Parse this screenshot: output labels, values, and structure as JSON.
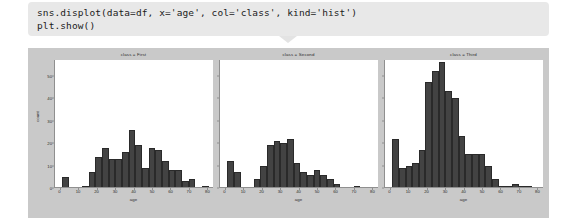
{
  "code_cell": {
    "lines": [
      "sns.displot(data=df, x='age', col='class', kind='hist')",
      "plt.show()"
    ],
    "background_color": "#e8e8e8"
  },
  "figure": {
    "background_color": "#c9c9c9",
    "panel_background_color": "#ffffff",
    "bar_color": "#434343"
  },
  "chart_data": {
    "type": "bar",
    "title": "",
    "subplot_layout": "1x3 (col='class')",
    "xlabel": "age",
    "ylabel": "count",
    "xlim": [
      -3,
      83
    ],
    "ylim": [
      0,
      57
    ],
    "xticks": [
      0,
      10,
      20,
      30,
      40,
      50,
      60,
      70,
      80
    ],
    "yticks": [
      0,
      10,
      20,
      30,
      40,
      50
    ],
    "grid": false,
    "legend": "none",
    "bin_width": 3.6,
    "panels": [
      {
        "title": "class = First",
        "bin_starts": [
          0.9,
          4.5,
          8.1,
          11.7,
          15.3,
          18.9,
          22.5,
          26.1,
          29.7,
          33.3,
          36.9,
          40.5,
          44.1,
          47.7,
          51.3,
          54.9,
          58.5,
          62.1,
          65.7,
          69.3,
          72.9,
          76.5
        ],
        "values": [
          5,
          0,
          0,
          1,
          7,
          14,
          18,
          13,
          13,
          16,
          26,
          19,
          9,
          18,
          17,
          12,
          8,
          8,
          3,
          4,
          0,
          1
        ]
      },
      {
        "title": "class = Second",
        "bin_starts": [
          0.9,
          4.5,
          8.1,
          11.7,
          15.3,
          18.9,
          22.5,
          26.1,
          29.7,
          33.3,
          36.9,
          40.5,
          44.1,
          47.7,
          51.3,
          54.9,
          58.5,
          62.1,
          65.7,
          69.3
        ],
        "values": [
          12,
          7,
          0,
          0,
          4,
          10,
          19,
          21,
          20,
          22,
          11,
          7,
          6,
          8,
          6,
          4,
          2,
          0,
          0,
          1
        ]
      },
      {
        "title": "class = Third",
        "bin_starts": [
          0.9,
          4.5,
          8.1,
          11.7,
          15.3,
          18.9,
          22.5,
          26.1,
          29.7,
          33.3,
          36.9,
          40.5,
          44.1,
          47.7,
          51.3,
          54.9,
          58.5,
          62.1,
          65.7,
          69.3,
          72.9
        ],
        "values": [
          22,
          9,
          10,
          11,
          17,
          47,
          52,
          56,
          43,
          40,
          23,
          15,
          15,
          15,
          10,
          4,
          1,
          1,
          2,
          1,
          1
        ]
      }
    ]
  }
}
